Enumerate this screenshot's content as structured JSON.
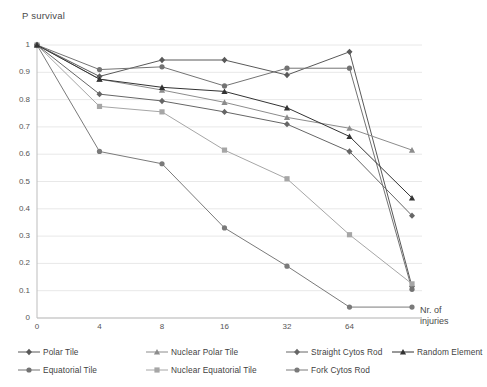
{
  "chart_data": {
    "type": "line",
    "title": "",
    "ylabel": "P survival",
    "xlabel": "Nr. of injuries",
    "xlabel_line1": "Nr. of",
    "xlabel_line2": "injuries",
    "categories": [
      "0",
      "4",
      "8",
      "16",
      "32",
      "64",
      "128"
    ],
    "xticklabels": [
      "0",
      "4",
      "8",
      "16",
      "32",
      "64"
    ],
    "yticklabels": [
      "0",
      "0.1",
      "0.2",
      "0.3",
      "0.4",
      "0.5",
      "0.6",
      "0.7",
      "0.8",
      "0.9",
      "1"
    ],
    "ylim": [
      0,
      1
    ],
    "grid": true,
    "legend_position": "bottom",
    "series": [
      {
        "name": "Polar Tile",
        "marker": "diamond",
        "color": "#595959",
        "values": [
          1,
          0.885,
          0.945,
          0.945,
          0.89,
          0.975,
          0.115
        ]
      },
      {
        "name": "Equatorial Tile",
        "marker": "circle",
        "color": "#737373",
        "values": [
          1,
          0.91,
          0.92,
          0.85,
          0.915,
          0.915,
          0.105
        ]
      },
      {
        "name": "Nuclear Polar Tile",
        "marker": "triangle",
        "color": "#8c8c8c",
        "values": [
          1,
          0.875,
          0.835,
          0.79,
          0.735,
          0.695,
          0.615
        ]
      },
      {
        "name": "Nuclear Equatorial Tile",
        "marker": "square",
        "color": "#a6a6a6",
        "values": [
          1,
          0.775,
          0.755,
          0.615,
          0.51,
          0.305,
          0.125
        ]
      },
      {
        "name": "Straight Cytos Rod",
        "marker": "diamond",
        "color": "#666666",
        "values": [
          1,
          0.82,
          0.795,
          0.755,
          0.71,
          0.61,
          0.375
        ]
      },
      {
        "name": "Fork Cytos Rod",
        "marker": "circle",
        "color": "#7a7a7a",
        "values": [
          1,
          0.61,
          0.565,
          0.33,
          0.19,
          0.04,
          0.04
        ]
      },
      {
        "name": "Random Element",
        "marker": "triangle",
        "color": "#333333",
        "values": [
          1,
          0.875,
          0.845,
          0.83,
          0.77,
          0.665,
          0.44
        ]
      }
    ]
  },
  "axis": {
    "yticks": [
      {
        "label": "1",
        "value": 1
      },
      {
        "label": "0.9",
        "value": 0.9
      },
      {
        "label": "0.8",
        "value": 0.8
      },
      {
        "label": "0.7",
        "value": 0.7
      },
      {
        "label": "0.6",
        "value": 0.6
      },
      {
        "label": "0.5",
        "value": 0.5
      },
      {
        "label": "0.4",
        "value": 0.4
      },
      {
        "label": "0.3",
        "value": 0.3
      },
      {
        "label": "0.2",
        "value": 0.2
      },
      {
        "label": "0.1",
        "value": 0.1
      },
      {
        "label": "0",
        "value": 0
      }
    ],
    "xticks": [
      {
        "label": "0",
        "index": 0
      },
      {
        "label": "4",
        "index": 1
      },
      {
        "label": "8",
        "index": 2
      },
      {
        "label": "16",
        "index": 3
      },
      {
        "label": "32",
        "index": 4
      },
      {
        "label": "64",
        "index": 5
      }
    ]
  },
  "legend": {
    "entries": [
      {
        "label": "Polar Tile",
        "marker": "diamond",
        "color": "#595959"
      },
      {
        "label": "Nuclear Polar Tile",
        "marker": "triangle",
        "color": "#8c8c8c"
      },
      {
        "label": "Straight Cytos Rod",
        "marker": "diamond",
        "color": "#666666"
      },
      {
        "label": "Random Element",
        "marker": "triangle",
        "color": "#333333"
      },
      {
        "label": "Equatorial Tile",
        "marker": "circle",
        "color": "#737373"
      },
      {
        "label": "Nuclear Equatorial Tile",
        "marker": "square",
        "color": "#a6a6a6"
      },
      {
        "label": "Fork Cytos Rod",
        "marker": "circle",
        "color": "#7a7a7a"
      }
    ]
  }
}
